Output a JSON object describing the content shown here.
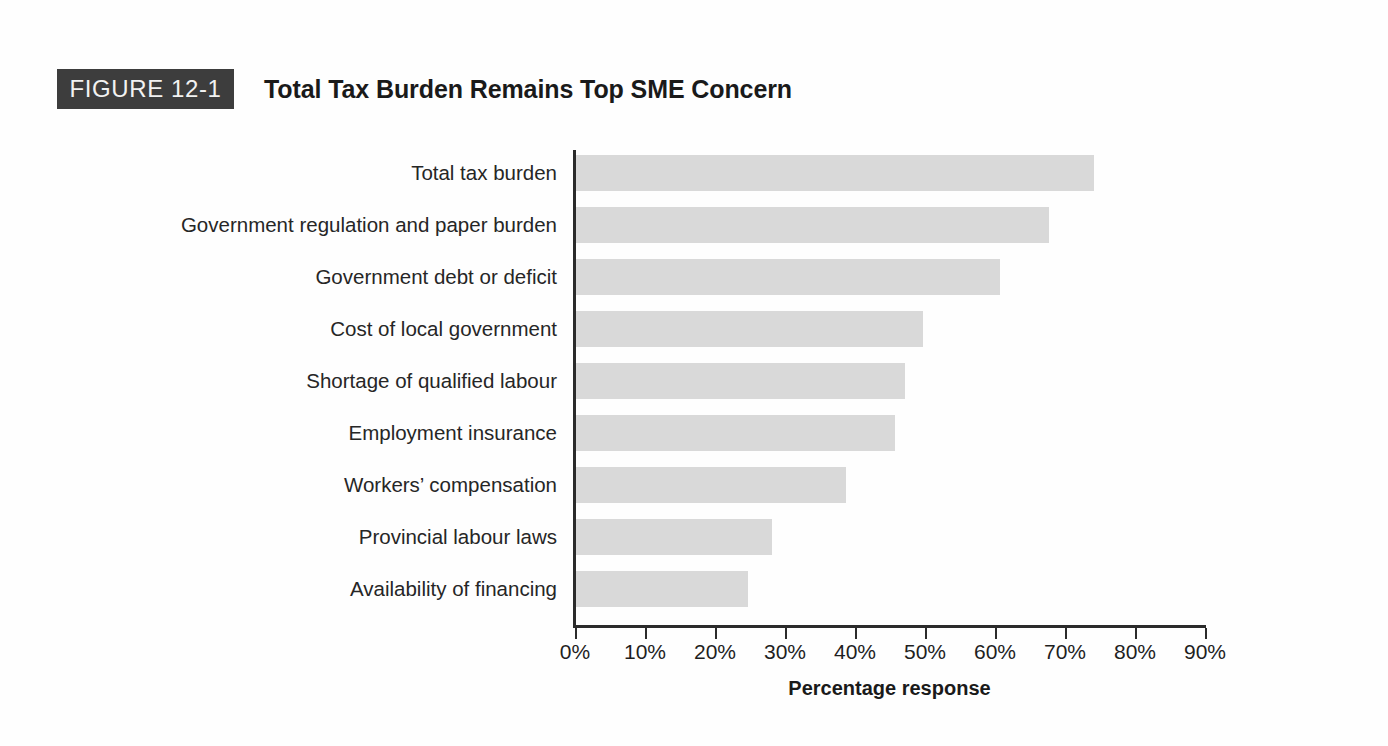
{
  "figure": {
    "badge_label": "FIGURE 12-1",
    "title": "Total Tax Burden Remains Top SME Concern",
    "badge_bg": "#3d3d3d",
    "badge_text_color": "#f2f2f2"
  },
  "chart_data": {
    "type": "bar",
    "orientation": "horizontal",
    "title": "Total Tax Burden Remains Top SME Concern",
    "xlabel": "Percentage response",
    "ylabel": "",
    "categories": [
      "Total tax burden",
      "Government regulation and paper burden",
      "Government debt or deficit",
      "Cost of local government",
      "Shortage of qualified labour",
      "Employment insurance",
      "Workers’ compensation",
      "Provincial labour laws",
      "Availability of financing"
    ],
    "values": [
      74,
      67.5,
      60.5,
      49.5,
      47,
      45.5,
      38.5,
      28,
      24.5
    ],
    "value_unit": "%",
    "xlim": [
      0,
      90
    ],
    "xticks": [
      0,
      10,
      20,
      30,
      40,
      50,
      60,
      70,
      80,
      90
    ],
    "xtick_labels": [
      "0%",
      "10%",
      "20%",
      "30%",
      "40%",
      "50%",
      "60%",
      "70%",
      "80%",
      "90%"
    ],
    "grid": false,
    "legend": false,
    "bar_color": "#d9d9d9",
    "axis_color": "#2b2b2b"
  }
}
